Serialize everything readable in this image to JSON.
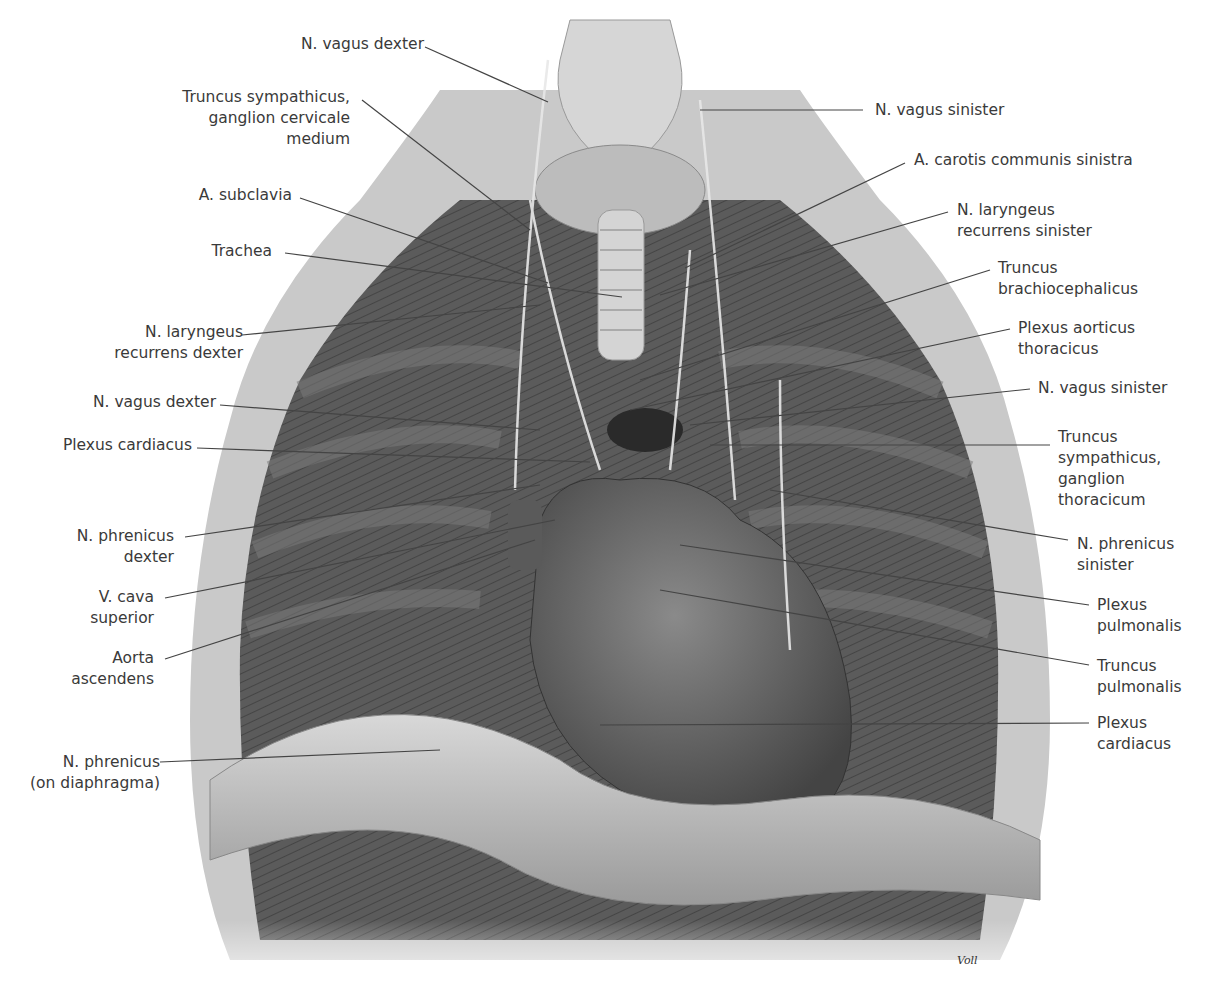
{
  "figure": {
    "artist_signature": "Voll",
    "colors": {
      "background": "#ffffff",
      "label_text": "#3a3a3a",
      "leader_line": "#444444"
    }
  },
  "labels_left": [
    {
      "id": "n-vagus-dexter-top",
      "lines": [
        "N. vagus dexter"
      ]
    },
    {
      "id": "truncus-sympathicus-cervicale",
      "lines": [
        "Truncus sympathicus,",
        "ganglion cervicale",
        "medium"
      ]
    },
    {
      "id": "a-subclavia",
      "lines": [
        "A. subclavia"
      ]
    },
    {
      "id": "trachea",
      "lines": [
        "Trachea"
      ]
    },
    {
      "id": "n-laryngeus-recurrens-dexter",
      "lines": [
        "N. laryngeus",
        "recurrens dexter"
      ]
    },
    {
      "id": "n-vagus-dexter-mid",
      "lines": [
        "N. vagus dexter"
      ]
    },
    {
      "id": "plexus-cardiacus-left",
      "lines": [
        "Plexus cardiacus"
      ]
    },
    {
      "id": "n-phrenicus-dexter",
      "lines": [
        "N. phrenicus",
        "dexter"
      ]
    },
    {
      "id": "v-cava-superior",
      "lines": [
        "V. cava",
        "superior"
      ]
    },
    {
      "id": "aorta-ascendens",
      "lines": [
        "Aorta",
        "ascendens"
      ]
    },
    {
      "id": "n-phrenicus-diaphragma",
      "lines": [
        "N. phrenicus",
        "(on diaphragma)"
      ]
    }
  ],
  "labels_right": [
    {
      "id": "n-vagus-sinister-top",
      "lines": [
        "N. vagus sinister"
      ]
    },
    {
      "id": "a-carotis-communis-sinistra",
      "lines": [
        "A. carotis communis sinistra"
      ]
    },
    {
      "id": "n-laryngeus-recurrens-sinister",
      "lines": [
        "N. laryngeus",
        "recurrens sinister"
      ]
    },
    {
      "id": "truncus-brachiocephalicus",
      "lines": [
        "Truncus",
        "brachiocephalicus"
      ]
    },
    {
      "id": "plexus-aorticus-thoracicus",
      "lines": [
        "Plexus aorticus",
        "thoracicus"
      ]
    },
    {
      "id": "n-vagus-sinister-mid",
      "lines": [
        "N. vagus sinister"
      ]
    },
    {
      "id": "truncus-sympathicus-thoracicum",
      "lines": [
        "Truncus",
        "sympathicus,",
        "ganglion",
        "thoracicum"
      ]
    },
    {
      "id": "n-phrenicus-sinister",
      "lines": [
        "N. phrenicus",
        "sinister"
      ]
    },
    {
      "id": "plexus-pulmonalis",
      "lines": [
        "Plexus",
        "pulmonalis"
      ]
    },
    {
      "id": "truncus-pulmonalis",
      "lines": [
        "Truncus",
        "pulmonalis"
      ]
    },
    {
      "id": "plexus-cardiacus-right",
      "lines": [
        "Plexus",
        "cardiacus"
      ]
    }
  ]
}
